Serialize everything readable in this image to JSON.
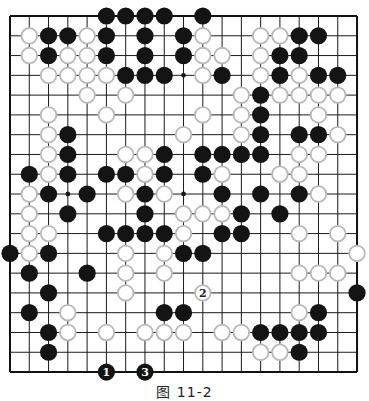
{
  "board": {
    "size": 19,
    "origin_x": 10,
    "origin_y": 16,
    "spacing_x": 19.28,
    "spacing_y": 19.78,
    "stone_radius": 8.6,
    "line_color": "#1a1a1a",
    "border_color": "#111111",
    "black_color": "#141414",
    "white_fill": "#ffffff",
    "white_stroke": "#b8b8b8",
    "star_points": [
      [
        3,
        3
      ],
      [
        3,
        9
      ],
      [
        3,
        15
      ],
      [
        9,
        3
      ],
      [
        9,
        9
      ],
      [
        9,
        15
      ],
      [
        15,
        3
      ],
      [
        15,
        9
      ],
      [
        15,
        15
      ]
    ],
    "rows": [
      ".....BBBB.B........",
      ".WBBWB.B.BW..WWBB..",
      ".WBWWB.B.BWW.WBB...",
      "..WWWWBBB.WB.WBWBB.",
      "....W.W.....WBWWWW.",
      "..W..W....W.WB..W..",
      "..WB.....W..WB.BBW.",
      "..WB..WWB.BBBB.WW..",
      ".BWB.BBWB.BW..WW...",
      ".WB.B.WBW..B.B.BW..",
      ".W.B...B.WWWB.B....",
      ".WW..BBBBW.BB..W.W.",
      "BWB...W.WBB.......W",
      ".B..B.W.W......WWW.",
      "..B...W...........BB",
      ".B.W....BB.....WB..",
      "..BW.W.WWW.WWBBBB..",
      "..B..........WWB...",
      "..................."
    ]
  },
  "numbered_moves": [
    {
      "number": "1",
      "color": "black",
      "col": 5,
      "row": 18
    },
    {
      "number": "2",
      "color": "white",
      "col": 10,
      "row": 14
    },
    {
      "number": "3",
      "color": "black",
      "col": 7,
      "row": 18
    }
  ],
  "caption": "图 11-2"
}
